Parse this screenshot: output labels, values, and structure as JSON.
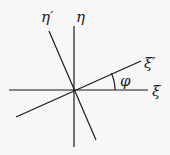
{
  "diagram": {
    "type": "coordinate-rotation",
    "origin": [
      74,
      90
    ],
    "axes": {
      "xi": {
        "label": "ξ",
        "x1": 9,
        "y1": 90,
        "x2": 148,
        "y2": 90,
        "label_pos": [
          153,
          96
        ]
      },
      "eta": {
        "label": "η",
        "x1": 74,
        "y1": 26,
        "x2": 74,
        "y2": 147,
        "label_pos": [
          77,
          22
        ]
      },
      "xi_prime": {
        "label": "ξ′",
        "x1": 16,
        "y1": 117,
        "x2": 141,
        "y2": 61,
        "label_pos": [
          145,
          68
        ]
      },
      "eta_prime": {
        "label": "η′",
        "x1": 49,
        "y1": 31,
        "x2": 96,
        "y2": 140,
        "label_pos": [
          42,
          24
        ]
      }
    },
    "angle": {
      "label": "φ",
      "arc_radius": 41,
      "label_pos": [
        121,
        86
      ]
    },
    "colors": {
      "stroke": "#1a1a1a",
      "background": "#f7f7f7"
    }
  }
}
